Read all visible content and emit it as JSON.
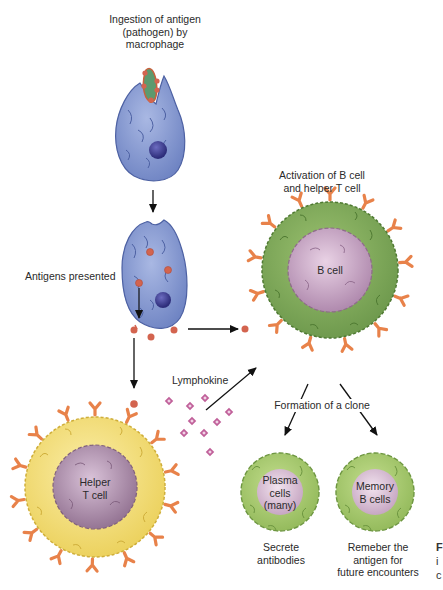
{
  "labels": {
    "ingestion": "Ingestion of antigen\n(pathogen) by\nmacrophage",
    "ingestion_l1": "Ingestion of antigen",
    "ingestion_l2": "(pathogen) by",
    "ingestion_l3": "macrophage",
    "antigens_presented": "Antigens presented",
    "activation_l1": "Activation of B cell",
    "activation_l2": "and helper T cell",
    "lymphokine": "Lymphokine",
    "formation_clone": "Formation of a clone",
    "secrete_l1": "Secrete",
    "secrete_l2": "antibodies",
    "remember_l1": "Remeber the",
    "remember_l2": "antigen for",
    "remember_l3": "future encounters"
  },
  "cells": {
    "b_cell": "B cell",
    "helper_l1": "Helper",
    "helper_l2": "T cell",
    "plasma_l1": "Plasma",
    "plasma_l2": "cells",
    "plasma_l3": "(many)",
    "memory_l1": "Memory",
    "memory_l2": "B cells"
  },
  "edge_fragment": {
    "l1": "F",
    "l2": "i",
    "l3": "c"
  },
  "colors": {
    "macrophage": "#7f95cf",
    "macrophage_edge": "#4d61a3",
    "nucleus_macrophage": "#3f3f8f",
    "antigen": "#d3644f",
    "pathogen": "#5c9a6e",
    "b_cell_body": "#7ea65a",
    "b_cell_nucleus": "#b98fb5",
    "helper_body": "#f1de7b",
    "helper_nucleus": "#9f7f9f",
    "plasma_body": "#a3c56d",
    "receptor": "#e8824a",
    "lymphokine_dot": "#c0609a",
    "arrow": "#111111"
  }
}
